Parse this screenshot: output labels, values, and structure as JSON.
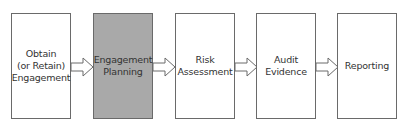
{
  "diagram": {
    "type": "process-flow",
    "steps": [
      {
        "label": "Obtain\n(or Retain)\nEngagement",
        "highlighted": false
      },
      {
        "label": "Engagement\nPlanning",
        "highlighted": true
      },
      {
        "label": "Risk\nAssessment",
        "highlighted": false
      },
      {
        "label": "Audit\nEvidence",
        "highlighted": false
      },
      {
        "label": "Reporting",
        "highlighted": false
      }
    ],
    "connectors": [
      {
        "from": 0,
        "to": 1,
        "style": "hollow-block-arrow"
      },
      {
        "from": 1,
        "to": 2,
        "style": "hollow-block-arrow"
      },
      {
        "from": 2,
        "to": 3,
        "style": "hollow-block-arrow"
      },
      {
        "from": 3,
        "to": 4,
        "style": "hollow-block-arrow"
      }
    ],
    "colors": {
      "highlight_fill": "#a9a9a9",
      "box_fill": "#ffffff",
      "stroke": "#6a6a6a"
    }
  }
}
